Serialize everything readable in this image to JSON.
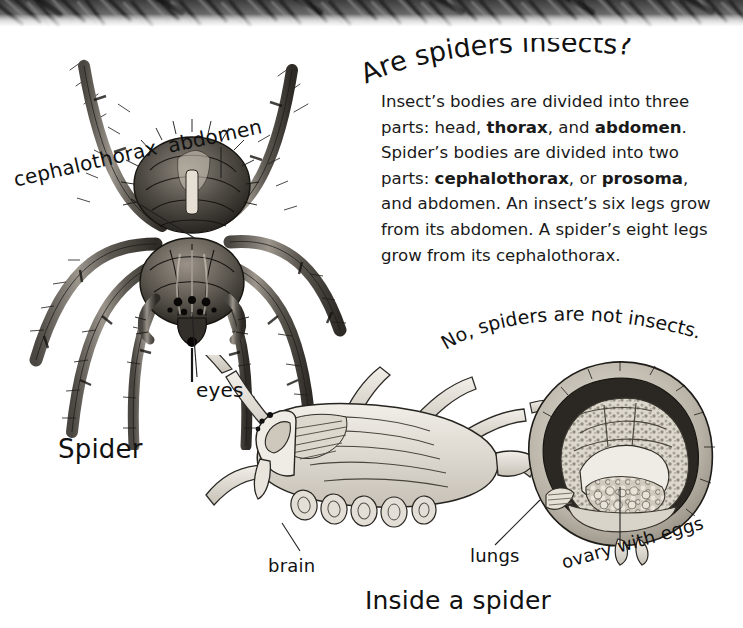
{
  "page": {
    "width": 743,
    "height": 628,
    "background": "#ffffff",
    "ink_color": "#111111"
  },
  "decor": {
    "top_band_name": "spider-fur-texture-band"
  },
  "heading": {
    "text": "Are spiders insects?"
  },
  "body": {
    "paragraph_parts": [
      {
        "text": "Insect’s bodies are divided into three parts: head, ",
        "bold": false
      },
      {
        "text": "thorax",
        "bold": true
      },
      {
        "text": ", and ",
        "bold": false
      },
      {
        "text": "abdomen",
        "bold": true
      },
      {
        "text": ". Spider’s bodies are divided into two parts: ",
        "bold": false
      },
      {
        "text": "cephalothorax",
        "bold": true
      },
      {
        "text": ", or ",
        "bold": false
      },
      {
        "text": "prosoma",
        "bold": true
      },
      {
        "text": ", and abdomen. An insect’s six legs grow from its abdomen. A spider’s eight legs grow from its cephalothorax.",
        "bold": false
      }
    ],
    "plain_text": "Insect’s bodies are divided into three parts: head, thorax, and abdomen. Spider’s bodies are divided into two parts: cephalothorax, or prosoma, and abdomen. An insect’s six legs grow from its abdomen. A spider’s eight legs grow from its cephalothorax."
  },
  "answer": {
    "text": "No, spiders are not insects."
  },
  "labels": {
    "cephalothorax": "cephalothorax",
    "abdomen": "abdomen",
    "eyes": "eyes",
    "spider": "Spider",
    "brain": "brain",
    "lungs": "lungs",
    "ovary_with_eggs": "ovary with eggs"
  },
  "caption": {
    "inside_a_spider": "Inside a spider"
  },
  "illustrations": {
    "top_spider": "dorsal-view-spider-drawing",
    "cutaway_spider": "spider-anatomy-cutaway-drawing"
  }
}
